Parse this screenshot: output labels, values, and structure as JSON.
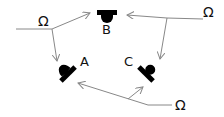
{
  "diagram": {
    "type": "sound-source to detector arrangement",
    "detectors": [
      {
        "id": "B",
        "label": "B",
        "position": "top-center"
      },
      {
        "id": "A",
        "label": "A",
        "position": "lower-left"
      },
      {
        "id": "C",
        "label": "C",
        "position": "lower-right"
      }
    ],
    "sources": [
      {
        "id": "omega-top-left",
        "label": "Ω",
        "targets": [
          "B",
          "A"
        ]
      },
      {
        "id": "omega-top-right",
        "label": "Ω",
        "targets": [
          "B",
          "C"
        ]
      },
      {
        "id": "omega-bottom",
        "label": "Ω",
        "targets": [
          "A",
          "C"
        ]
      }
    ],
    "colors": {
      "line": "#888888",
      "detector": "#000000",
      "text": "#111111"
    }
  }
}
